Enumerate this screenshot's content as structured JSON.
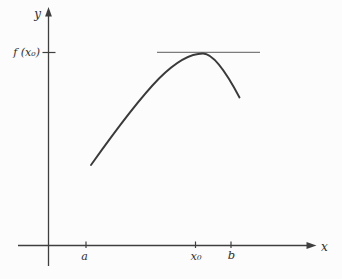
{
  "figure": {
    "y_axis_label": "y",
    "x_axis_label": "x",
    "fx0_label": "f (x₀)",
    "tick_a_label": "a",
    "tick_x0_label": "x₀",
    "tick_b_label": "b",
    "colors": {
      "background": "#fcfcfc",
      "axis": "#3f3f3f",
      "curve": "#3a3a3a",
      "tangent_line": "#5c5c5c",
      "label": "#2e2e2e"
    }
  }
}
